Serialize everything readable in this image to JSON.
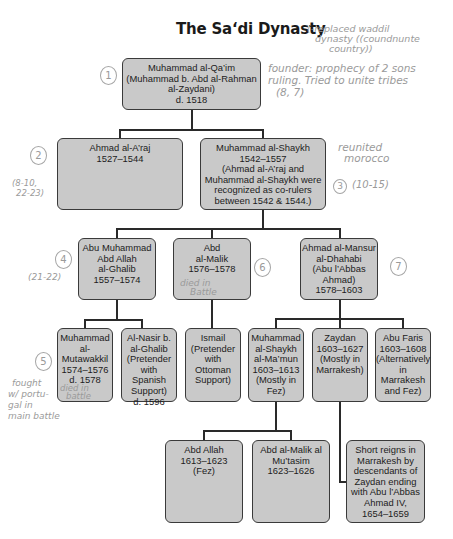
{
  "title": "The Sa‘di Dynasty",
  "nodes": {
    "qaim": [
      "Muhammad al-Qa’im",
      "(Muhammad b. Abd al-Rahman",
      "al-Zaydani)",
      "d. 1518"
    ],
    "araj": [
      "Ahmad al-A’raj",
      "1527–1544"
    ],
    "shaykh": [
      "Muhammad al-Shaykh",
      "1542–1557",
      "(Ahmad al-A’raj and",
      "Muhammad al-Shaykh were",
      "recognized as co-rulers",
      "between 1542 & 1544.)"
    ],
    "ghalib": [
      "Abu Muhammad",
      "Abd Allah",
      "al-Ghalib",
      "1557–1574"
    ],
    "malik": [
      "Abd",
      "al-Malik",
      "1576–1578"
    ],
    "mansur": [
      "Ahmad al-Mansur",
      "al-Dhahabi",
      "(Abu l’Abbas",
      "Ahmad)",
      "1578–1603"
    ],
    "mutawakkil": [
      "Muhammad",
      "al-",
      "Mutawakkil",
      "1574–1576",
      "d. 1578"
    ],
    "nasir": [
      "Al-Nasir b.",
      "al-Ghalib",
      "(Pretender",
      "with",
      "Spanish",
      "Support)",
      "d. 1596"
    ],
    "ismail": [
      "Ismail",
      "(Pretender",
      "with",
      "Ottoman",
      "Support)"
    ],
    "mamun": [
      "Muhammad",
      "al-Shaykh",
      "al-Ma’mun",
      "1603–1613",
      "(Mostly in",
      "Fez)"
    ],
    "zaydan": [
      "Zaydan",
      "1603–1627",
      "(Mostly in",
      "Marrakesh)"
    ],
    "faris": [
      "Abu Faris",
      "1603–1608",
      "(Alternatively",
      "in",
      "Marrakesh",
      "and Fez)"
    ],
    "abdallah": [
      "Abd Allah",
      "1613–1623",
      "(Fez)"
    ],
    "mutasim": [
      "Abd al-Malik al",
      "Mu’tasim",
      "1623–1626"
    ],
    "short": [
      "Short reigns in",
      "Marrakesh by",
      "descendants of",
      "Zaydan ending",
      "with Abu l’Abbas",
      "Ahmad IV,",
      "1654–1659"
    ]
  },
  "annotations": {
    "title_note": [
      "(-replaced waddil",
      "dynasty ((coundnunte",
      "country))"
    ],
    "founder_note": [
      "founder: prophecy of 2 sons",
      "ruling. Tried to unite tribes",
      "(8, 7)"
    ],
    "reunited_note": [
      "reunited",
      "morocco"
    ],
    "pages_3": "(10-15)",
    "pages_2": [
      "(8-10,",
      "22-23)"
    ],
    "pages_4": "(21-22)",
    "malik_note": [
      "died in",
      "Battle"
    ],
    "mutawakkil_note": [
      "died in",
      "battle"
    ],
    "fought_note": [
      "fought",
      "w/ portu-",
      "gal in",
      "main battle"
    ],
    "numbers": [
      "1",
      "2",
      "3",
      "4",
      "5",
      "6",
      "7"
    ]
  }
}
